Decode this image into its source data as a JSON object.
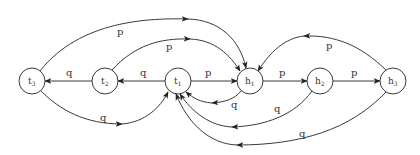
{
  "diagram": {
    "type": "state-transition-graph",
    "nodes": [
      {
        "id": "t3",
        "base": "t",
        "sub": "3",
        "x": 32,
        "y": 81
      },
      {
        "id": "t2",
        "base": "t",
        "sub": "2",
        "x": 105,
        "y": 81
      },
      {
        "id": "t1",
        "base": "t",
        "sub": "1",
        "x": 178,
        "y": 81
      },
      {
        "id": "h1",
        "base": "h",
        "sub": "1",
        "x": 250,
        "y": 81
      },
      {
        "id": "h2",
        "base": "h",
        "sub": "2",
        "x": 320,
        "y": 81
      },
      {
        "id": "h3",
        "base": "h",
        "sub": "3",
        "x": 393,
        "y": 81
      }
    ],
    "edges": [
      {
        "id": "t2-t3",
        "from": "t2",
        "to": "t3",
        "label": "q"
      },
      {
        "id": "t1-t2",
        "from": "t1",
        "to": "t2",
        "label": "q"
      },
      {
        "id": "t1-h1",
        "from": "t1",
        "to": "h1",
        "label": "p"
      },
      {
        "id": "h1-h2",
        "from": "h1",
        "to": "h2",
        "label": "p"
      },
      {
        "id": "h2-h3",
        "from": "h2",
        "to": "h3",
        "label": "p"
      },
      {
        "id": "t3-h1",
        "from": "t3",
        "to": "h1",
        "label": "p"
      },
      {
        "id": "t2-h1",
        "from": "t2",
        "to": "h1",
        "label": "p"
      },
      {
        "id": "h3-h1",
        "from": "h3",
        "to": "h1",
        "label": "p"
      },
      {
        "id": "t3-t1",
        "from": "t3",
        "to": "t1",
        "label": "q"
      },
      {
        "id": "h1-t1",
        "from": "h1",
        "to": "t1",
        "label": "q"
      },
      {
        "id": "h2-t1",
        "from": "h2",
        "to": "t1",
        "label": "q"
      },
      {
        "id": "h3-t1",
        "from": "h3",
        "to": "t1",
        "label": "q"
      }
    ]
  }
}
